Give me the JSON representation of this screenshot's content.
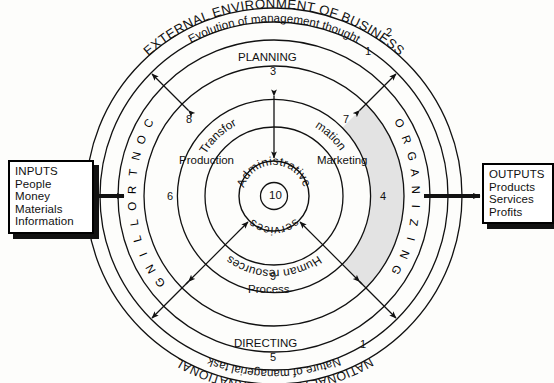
{
  "diagram": {
    "center": {
      "x": 274,
      "y": 196
    }
  },
  "inputs_box": {
    "name": "INPUTS",
    "heading": "INPUTS",
    "items": [
      "People",
      "Money",
      "Materials",
      "Information"
    ]
  },
  "outputs_box": {
    "name": "OUTPUTS",
    "heading": "OUTPUTS",
    "items": [
      "Products",
      "Services",
      "Profits"
    ]
  },
  "rings": {
    "outer_top": {
      "label": "EXTERNAL ENVIRONMENT OF BUSINESS",
      "number": "2"
    },
    "outer_bottom": {
      "label": "NATIONAL AND INTERNATIONAL",
      "number": ""
    },
    "second_top": {
      "label": "Evolution of management thought",
      "number": "1"
    },
    "second_bottom": {
      "label": "Nature of managerial task",
      "number": "1"
    },
    "functions": [
      {
        "label": "PLANNING",
        "number": "3",
        "position": "top"
      },
      {
        "label": "ORGANIZING",
        "number": "4",
        "position": "right",
        "shaded": true
      },
      {
        "label": "DIRECTING",
        "number": "5",
        "position": "bottom"
      },
      {
        "label": "CONTROLLING",
        "number": "6",
        "position": "left"
      }
    ],
    "transformation": {
      "label_left": "Transfor",
      "label_right": "mation",
      "full_label": "Transformation",
      "number_left": "8",
      "number_right": "7"
    },
    "process": {
      "label": "Process",
      "number": "9"
    },
    "human_resources": {
      "label": "Human resources"
    },
    "production": {
      "label": "Production"
    },
    "marketing": {
      "label": "Marketing"
    },
    "core": {
      "label_top": "Administrative",
      "label_bottom": "services",
      "number": "10"
    }
  },
  "colors": {
    "stroke": "#111111",
    "shade": "#e3e3e3",
    "paper": "#fdfdfb"
  }
}
